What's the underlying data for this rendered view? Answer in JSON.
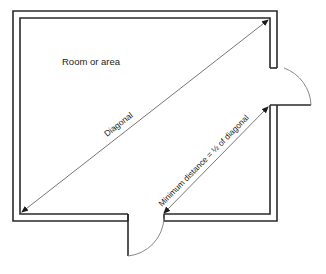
{
  "diagram": {
    "room_label": "Room or area",
    "diagonal_label": "Diagonal",
    "min_distance_label": "Minimum distance = ½ of diagonal",
    "colors": {
      "wall": "#2a2a2a",
      "arrow": "#666666",
      "door_arc": "#888888",
      "text": "#222222",
      "background": "#ffffff"
    },
    "elements": [
      {
        "type": "wall",
        "description": "Double-line room walls with two door openings"
      },
      {
        "type": "door",
        "location": "right wall",
        "swing": "outward"
      },
      {
        "type": "door",
        "location": "bottom wall",
        "swing": "outward"
      },
      {
        "type": "arrow",
        "label": "Diagonal",
        "from": "bottom-left inner corner",
        "to": "top-right inner corner"
      },
      {
        "type": "arrow",
        "label": "Minimum distance = ½ of diagonal",
        "from": "bottom door edge",
        "to": "right door edge"
      }
    ]
  }
}
